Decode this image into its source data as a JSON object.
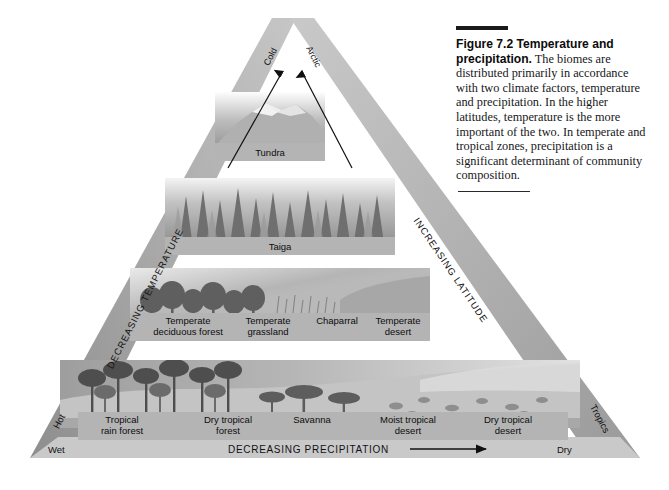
{
  "figure": {
    "caption_lead": "Figure 7.2  Temperature and precipitation.",
    "caption_body": " The biomes are distributed primarily in accordance with two climate factors, temperature and precipitation. In the higher latitudes, temperature is the more important of the two. In temperate and tropical zones, precipitation is a significant determinant of community composition."
  },
  "diagram": {
    "apex_labels": {
      "left": "Cold",
      "right": "Arctic"
    },
    "edge_labels": {
      "left": "DECREASING TEMPERATURE",
      "right": "INCREASING LATITUDE"
    },
    "corner_labels": {
      "bottom_left": "Hot",
      "bottom_right": "Tropics"
    },
    "base_axis": {
      "left": "Wet",
      "right": "Dry",
      "label": "DECREASING PRECIPITATION"
    },
    "rows": [
      {
        "name": "tundra-row",
        "labels": [
          {
            "lines": [
              "Tundra"
            ]
          }
        ]
      },
      {
        "name": "taiga-row",
        "labels": [
          {
            "lines": [
              "Taiga"
            ]
          }
        ]
      },
      {
        "name": "temperate-row",
        "labels": [
          {
            "lines": [
              "Temperate",
              "deciduous forest"
            ]
          },
          {
            "lines": [
              "Temperate",
              "grassland"
            ]
          },
          {
            "lines": [
              "Chaparral"
            ]
          },
          {
            "lines": [
              "Temperate",
              "desert"
            ]
          }
        ]
      },
      {
        "name": "tropical-row",
        "labels": [
          {
            "lines": [
              "Tropical",
              "rain forest"
            ]
          },
          {
            "lines": [
              "Dry tropical",
              "forest"
            ]
          },
          {
            "lines": [
              "Savanna"
            ]
          },
          {
            "lines": [
              "Moist tropical",
              "desert"
            ]
          },
          {
            "lines": [
              "Dry tropical",
              "desert"
            ]
          }
        ]
      }
    ]
  },
  "colors": {
    "frame_gray": "#a9a9a9",
    "label_band": "#b4b4b4",
    "base_band": "#c9c9c9",
    "ink": "#111111"
  }
}
